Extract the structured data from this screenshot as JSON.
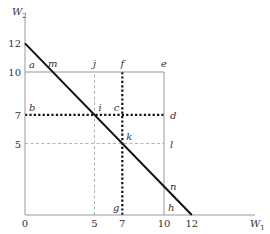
{
  "axes": {
    "x_label": "W",
    "x_sub": "1",
    "y_label": "W",
    "y_sub": "2",
    "origin_label": "0",
    "x_ticks": [
      {
        "value": 5,
        "label": "5"
      },
      {
        "value": 7,
        "label": "7"
      },
      {
        "value": 10,
        "label": "10"
      },
      {
        "value": 12,
        "label": "12"
      }
    ],
    "y_ticks": [
      {
        "value": 12,
        "label": "12"
      },
      {
        "value": 10,
        "label": "10"
      },
      {
        "value": 7,
        "label": "7"
      },
      {
        "value": 5,
        "label": "5"
      }
    ]
  },
  "budget_line": {
    "from": [
      0,
      12
    ],
    "to": [
      12,
      0
    ]
  },
  "box": {
    "x": 10,
    "y": 10
  },
  "guides": [
    {
      "name": "x5-guide",
      "style": "thin-dash",
      "from": [
        5,
        0
      ],
      "to": [
        5,
        10
      ]
    },
    {
      "name": "y5-guide",
      "style": "thin-dash",
      "from": [
        0,
        5
      ],
      "to": [
        10,
        5
      ]
    },
    {
      "name": "x7-guide",
      "style": "thick-dot",
      "from": [
        7,
        0
      ],
      "to": [
        7,
        10
      ]
    },
    {
      "name": "y7-guide",
      "style": "thick-dot",
      "from": [
        0,
        7
      ],
      "to": [
        10,
        7
      ]
    }
  ],
  "points": [
    {
      "label": "a",
      "x": 0,
      "y": 10,
      "pos": "ne"
    },
    {
      "label": "m",
      "x": 2,
      "y": 10,
      "pos": "n"
    },
    {
      "label": "j",
      "x": 5,
      "y": 10,
      "pos": "n"
    },
    {
      "label": "f",
      "x": 7,
      "y": 10,
      "pos": "n"
    },
    {
      "label": "e",
      "x": 10,
      "y": 10,
      "pos": "n"
    },
    {
      "label": "b",
      "x": 0,
      "y": 7,
      "pos": "ne"
    },
    {
      "label": "i",
      "x": 5,
      "y": 7,
      "pos": "ne"
    },
    {
      "label": "c",
      "x": 7,
      "y": 7,
      "pos": "nw"
    },
    {
      "label": "d",
      "x": 10,
      "y": 7,
      "pos": "e"
    },
    {
      "label": "k",
      "x": 7,
      "y": 5,
      "pos": "ne"
    },
    {
      "label": "l",
      "x": 10,
      "y": 5,
      "pos": "e"
    },
    {
      "label": "n",
      "x": 10,
      "y": 2,
      "pos": "e"
    },
    {
      "label": "g",
      "x": 7,
      "y": 0,
      "pos": "nw"
    },
    {
      "label": "h",
      "x": 10,
      "y": 0,
      "pos": "ne"
    }
  ]
}
